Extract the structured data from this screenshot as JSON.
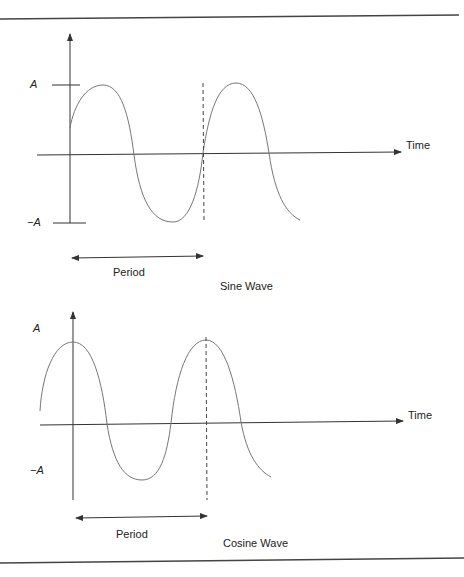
{
  "figure": {
    "colors": {
      "line": "#333333",
      "curve": "#777777",
      "rule": "#444444",
      "text": "#222222"
    },
    "sine_panel": {
      "caption": "Sine Wave",
      "y_axis_labels": {
        "positive_amplitude": "A",
        "negative_amplitude": "−A"
      },
      "x_axis_label": "Time",
      "period_label": "Period"
    },
    "cosine_panel": {
      "caption": "Cosine Wave",
      "y_axis_labels": {
        "positive_amplitude": "A",
        "negative_amplitude": "−A"
      },
      "x_axis_label": "Time",
      "period_label": "Period"
    }
  }
}
